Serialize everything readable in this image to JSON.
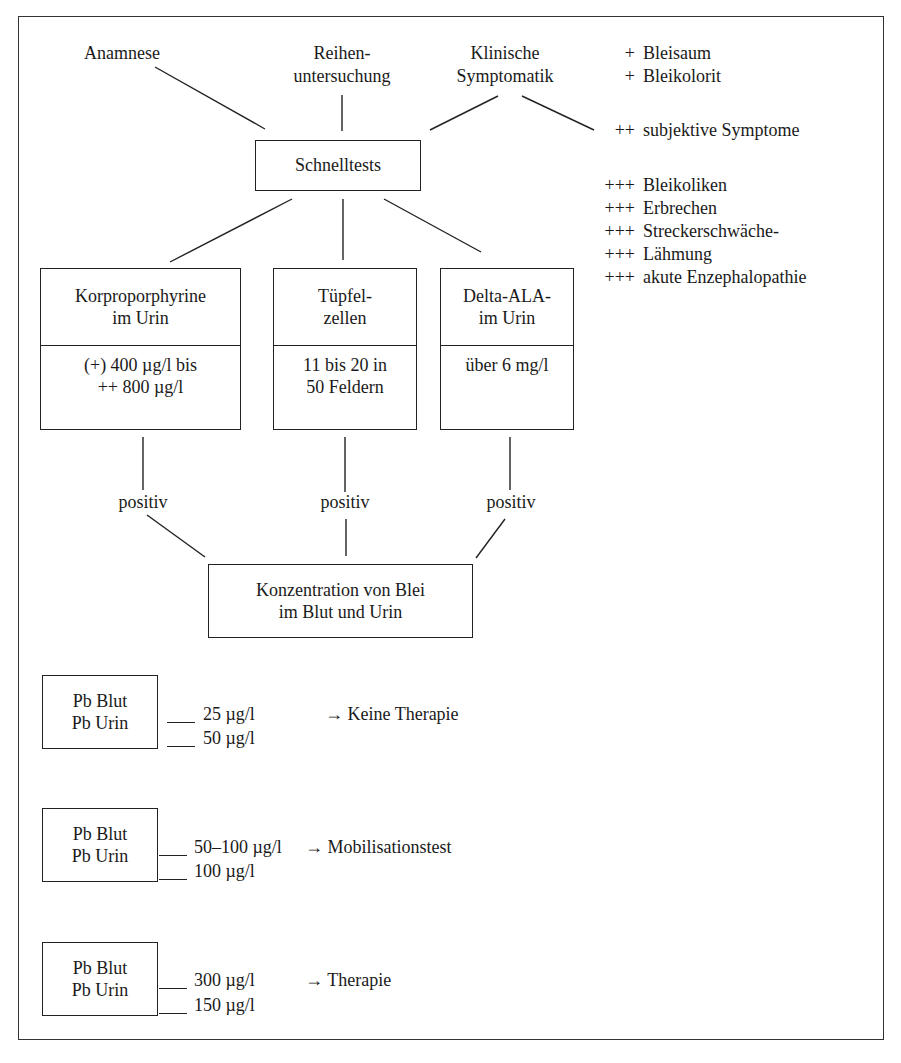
{
  "sources": {
    "anamnese": "Anamnese",
    "reihen_line1": "Reihen-",
    "reihen_line2": "untersuchung",
    "klinisch_line1": "Klinische",
    "klinisch_line2": "Symptomatik"
  },
  "symptoms": [
    {
      "mark": "+",
      "label": "Bleisaum"
    },
    {
      "mark": "+",
      "label": "Bleikolorit"
    },
    {
      "mark": "++",
      "label": "subjektive Symptome"
    },
    {
      "mark": "+++",
      "label": "Bleikoliken"
    },
    {
      "mark": "+++",
      "label": "Erbrechen"
    },
    {
      "mark": "+++",
      "label": "Streckerschwäche-"
    },
    {
      "mark": "+++",
      "label": "Lähmung"
    },
    {
      "mark": "+++",
      "label": "akute Enzephalopathie"
    }
  ],
  "schnelltests": "Schnelltests",
  "tests": [
    {
      "title1": "Korproporphyrine",
      "title2": "im Urin",
      "value1": "(+) 400 µg/l bis",
      "value2": "++ 800 µg/l",
      "result": "positiv"
    },
    {
      "title1": "Tüpfel-",
      "title2": "zellen",
      "value1": "11 bis 20 in",
      "value2": "50 Feldern",
      "result": "positiv"
    },
    {
      "title1": "Delta-ALA-",
      "title2": "im Urin",
      "value1": "über 6 mg/l",
      "value2": "",
      "result": "positiv"
    }
  ],
  "konzentration": {
    "line1": "Konzentration von Blei",
    "line2": "im Blut und Urin"
  },
  "thresholds": [
    {
      "label1": "Pb Blut",
      "label2": "Pb Urin",
      "blut": "25 µg/l",
      "urin": "50 µg/l",
      "action": "→ Keine Therapie"
    },
    {
      "label1": "Pb Blut",
      "label2": "Pb Urin",
      "blut": "50–100 µg/l",
      "urin": "100 µg/l",
      "action": "→ Mobilisationstest"
    },
    {
      "label1": "Pb Blut",
      "label2": "Pb Urin",
      "blut": "300 µg/l",
      "urin": "150 µg/l",
      "action": "→ Therapie"
    }
  ]
}
